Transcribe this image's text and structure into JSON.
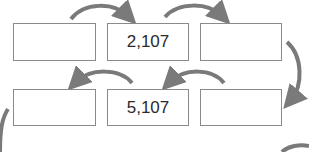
{
  "diagram": {
    "type": "number-pattern-flow",
    "arrow_color": "#7a7a7a",
    "box_border_color": "#8a8a8a",
    "rows": [
      {
        "boxes": [
          {
            "value": ""
          },
          {
            "value": "2,107"
          },
          {
            "value": ""
          }
        ],
        "arrow_direction": "left-to-right"
      },
      {
        "boxes": [
          {
            "value": ""
          },
          {
            "value": "5,107"
          },
          {
            "value": ""
          }
        ],
        "arrow_direction": "right-to-left"
      }
    ]
  }
}
